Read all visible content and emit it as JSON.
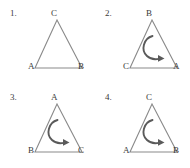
{
  "figure": {
    "type": "diagram",
    "colors": {
      "triangle_stroke": "#8a8a8a",
      "arrow_stroke": "#5a5a5a",
      "label_text": "#3a3a3a",
      "background": "#ffffff"
    },
    "items": [
      {
        "number": "1.",
        "apex_label": "C",
        "left_label": "A",
        "right_label": "B",
        "arrow": false,
        "arrow_direction": ""
      },
      {
        "number": "2.",
        "apex_label": "B",
        "left_label": "C",
        "right_label": "A",
        "arrow": true,
        "arrow_direction": "clockwise"
      },
      {
        "number": "3.",
        "apex_label": "A",
        "left_label": "B",
        "right_label": "C",
        "arrow": true,
        "arrow_direction": "clockwise"
      },
      {
        "number": "4.",
        "apex_label": "C",
        "left_label": "A",
        "right_label": "B",
        "arrow": true,
        "arrow_direction": "clockwise"
      }
    ]
  }
}
